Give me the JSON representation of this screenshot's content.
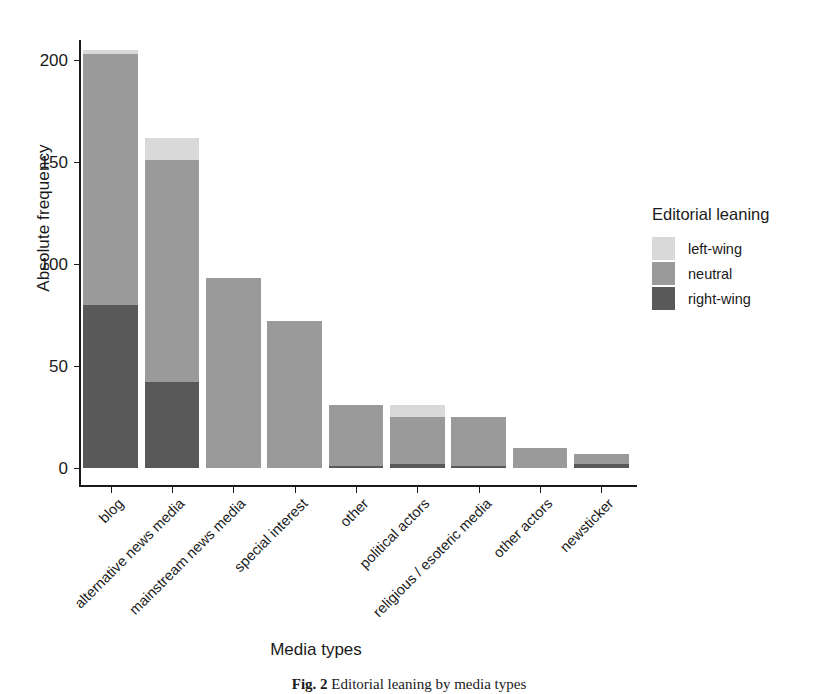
{
  "chart_data": {
    "type": "bar",
    "subtype": "stacked-bar",
    "title": "",
    "xlabel": "Media types",
    "ylabel": "Absolute frequency",
    "categories": [
      "blog",
      "alternative news media",
      "mainstream news media",
      "special interest",
      "other",
      "political actors",
      "religious / esoteric media",
      "other actors",
      "newsticker"
    ],
    "series": [
      {
        "name": "right-wing",
        "color": "#595959",
        "values": [
          80,
          42,
          0,
          0,
          1,
          2,
          1,
          0,
          2
        ]
      },
      {
        "name": "neutral",
        "color": "#9a9a9a",
        "values": [
          123,
          109,
          93,
          72,
          30,
          23,
          24,
          10,
          5
        ]
      },
      {
        "name": "left-wing",
        "color": "#d9d9d9",
        "values": [
          2,
          11,
          0,
          0,
          0,
          6,
          0,
          0,
          0
        ]
      }
    ],
    "totals": [
      205,
      162,
      93,
      72,
      31,
      31,
      25,
      10,
      7
    ],
    "ylim": [
      0,
      210
    ],
    "yticks": [
      0,
      50,
      100,
      150,
      200
    ],
    "ytick_labels": [
      "0",
      "50",
      "100",
      "150",
      "200"
    ],
    "grid": false,
    "legend_position": "right",
    "legend_title": "Editorial leaning",
    "legend_entries": [
      {
        "label": "left-wing",
        "color": "#d9d9d9"
      },
      {
        "label": "neutral",
        "color": "#9a9a9a"
      },
      {
        "label": "right-wing",
        "color": "#595959"
      }
    ]
  },
  "caption": {
    "label": "Fig. 2",
    "text": "Editorial leaning by media types"
  },
  "colors": {
    "background": "#ffffff",
    "axis": "#1a1a1a",
    "text": "#1a1a1a",
    "left_wing": "#d9d9d9",
    "neutral": "#9a9a9a",
    "right_wing": "#595959"
  }
}
